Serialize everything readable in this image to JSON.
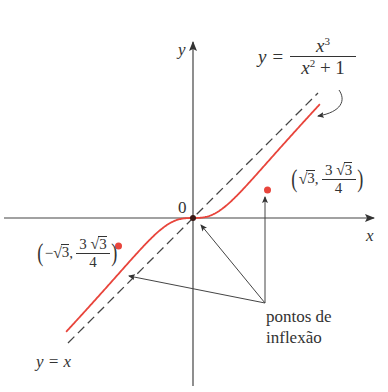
{
  "diagram": {
    "function_label": {
      "lhs": "y =",
      "numerator": "x",
      "numerator_exp": "3",
      "denominator_base": "x",
      "denominator_exp": "2",
      "denominator_rest": "+ 1"
    },
    "asymptote_label": "y = x",
    "axis_x_label": "x",
    "axis_y_label": "y",
    "origin_label": "0",
    "point_right": {
      "open": "(",
      "x_sqrt": "3",
      "sep": ",",
      "num_coef": "3",
      "num_sqrt": "3",
      "den": "4",
      "close": ")"
    },
    "point_left": {
      "open": "(",
      "minus": "−",
      "x_sqrt": "3",
      "sep": ",",
      "num_coef": "3",
      "num_sqrt": "3",
      "den": "4",
      "close": ")"
    },
    "note_line1": "pontos de",
    "note_line2": "inflexão",
    "colors": {
      "curve": "#e8453c",
      "axes": "#444444",
      "dashed": "#444444",
      "text": "#333333"
    }
  }
}
